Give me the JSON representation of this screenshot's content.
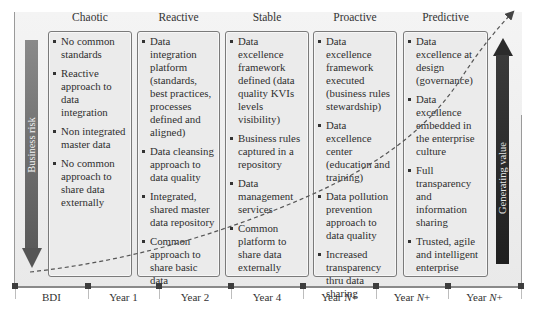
{
  "diagram": {
    "stages": [
      {
        "title": "Chaotic",
        "items": [
          "No common standards",
          "Reactive approach to data integration",
          "Non integrated master data",
          "No common approach to share data externally"
        ]
      },
      {
        "title": "Reactive",
        "items": [
          "Data integration platform (standards, best practices, processes defined and aligned)",
          "Data cleansing approach to data quality",
          "Integrated, shared master data repository",
          "Common approach to share basic data"
        ]
      },
      {
        "title": "Stable",
        "items": [
          "Data excellence framework defined (data quality KVIs levels visibility)",
          "Business rules captured in a repository",
          "Data management services",
          "Common platform to share data externally"
        ]
      },
      {
        "title": "Proactive",
        "items": [
          "Data excellence framework executed (business rules stewardship)",
          "Data excellence center (education and training)",
          "Data pollution prevention approach to data quality",
          "Increased transparency thru data sharing"
        ]
      },
      {
        "title": "Predictive",
        "items": [
          "Data excellence at design (governance)",
          "Data excellence embedded in the enterprise culture",
          "Full transparency and information sharing",
          "Trusted, agile and intelligent enterprise"
        ]
      }
    ],
    "left_arrow": {
      "label": "Business risk",
      "direction": "down",
      "color": "#6e6e6e"
    },
    "right_arrow": {
      "label": "Generating value",
      "direction": "up",
      "color": "#2b2b2b"
    },
    "timeline": {
      "labels": [
        {
          "prefix": "BDI",
          "italic": "",
          "suffix": ""
        },
        {
          "prefix": "Year 1",
          "italic": "",
          "suffix": ""
        },
        {
          "prefix": "Year 2",
          "italic": "",
          "suffix": ""
        },
        {
          "prefix": "Year 4",
          "italic": "",
          "suffix": ""
        },
        {
          "prefix": "Year ",
          "italic": "N",
          "suffix": "+"
        },
        {
          "prefix": "Year ",
          "italic": "N",
          "suffix": "+"
        },
        {
          "prefix": "Year ",
          "italic": "N",
          "suffix": "+"
        }
      ]
    },
    "curve": {
      "style": "dashed",
      "color": "#555555",
      "trend": "exponential-growth"
    }
  }
}
